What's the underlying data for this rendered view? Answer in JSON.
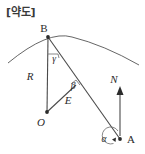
{
  "title": "[약도]",
  "diagram": {
    "type": "geometry-sketch",
    "background_color": "#ffffff",
    "line_color": "#4a4a4a",
    "text_color": "#2b2b2b",
    "points": [
      {
        "id": "B",
        "label": "B",
        "x": 48,
        "y": 37,
        "label_x": 44,
        "label_y": 32
      },
      {
        "id": "O",
        "label": "O",
        "x": 47,
        "y": 112,
        "label_x": 41,
        "label_y": 126
      },
      {
        "id": "A",
        "label": "A",
        "x": 120,
        "y": 139,
        "label_x": 127,
        "label_y": 143
      },
      {
        "id": "N",
        "label": "N",
        "x": 120,
        "y": 86,
        "label_x": 114,
        "label_y": 83
      }
    ],
    "segments": [
      {
        "id": "OB",
        "label": "R",
        "label_x": 30,
        "label_y": 80,
        "from": "O",
        "to": "B"
      },
      {
        "id": "OE",
        "label": "E",
        "label_x": 68,
        "label_y": 104,
        "from": "O",
        "to": "foot"
      },
      {
        "id": "BA",
        "label": "",
        "from": "B",
        "to": "A"
      }
    ],
    "angles": [
      {
        "id": "gamma",
        "label": "γ",
        "vertex": "B",
        "label_x": 54,
        "label_y": 59
      },
      {
        "id": "alpha",
        "label": "α",
        "vertex": "A",
        "label_x": 104,
        "label_y": 141
      },
      {
        "id": "beta",
        "label": "β",
        "vertex": "foot",
        "label_x": 73,
        "label_y": 89
      }
    ],
    "arrow": {
      "id": "north-arrow",
      "label": "N",
      "direction": "up"
    },
    "curve": {
      "id": "earth-arc",
      "description": "curved arc through B"
    }
  }
}
